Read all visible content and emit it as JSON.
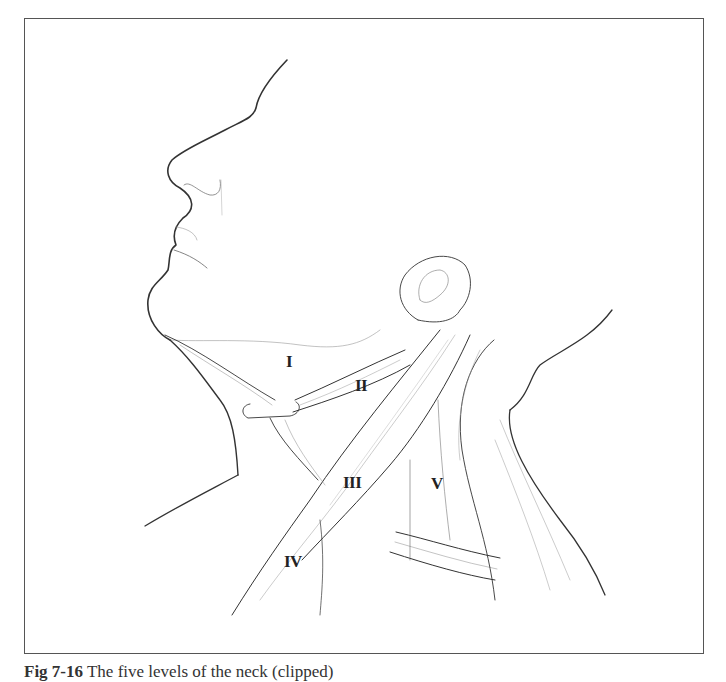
{
  "figure": {
    "type": "anatomical line illustration",
    "labels": [
      {
        "id": "level-1",
        "text": "I",
        "x": 286,
        "y": 362
      },
      {
        "id": "level-2",
        "text": "II",
        "x": 355,
        "y": 386
      },
      {
        "id": "level-3",
        "text": "III",
        "x": 343,
        "y": 483
      },
      {
        "id": "level-4",
        "text": "IV",
        "x": 284,
        "y": 562
      },
      {
        "id": "level-5",
        "text": "V",
        "x": 431,
        "y": 484
      }
    ],
    "caption": {
      "prefix": "Fig 7-16",
      "text": "The five levels of the neck (clipped)"
    }
  }
}
